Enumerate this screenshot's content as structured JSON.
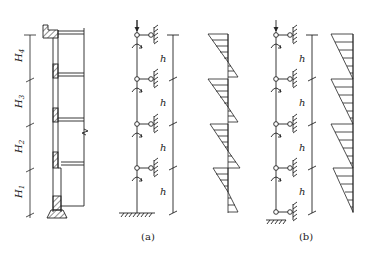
{
  "figure": {
    "section_labels": {
      "h4": "H",
      "h4_sub": "4",
      "h3": "H",
      "h3_sub": "3",
      "h2": "H",
      "h2_sub": "2",
      "h1": "H",
      "h1_sub": "1"
    },
    "story_label": "h",
    "captions": {
      "a": "(a)",
      "b": "(b)"
    },
    "colors": {
      "line": "#222222",
      "background": "#ffffff"
    }
  }
}
